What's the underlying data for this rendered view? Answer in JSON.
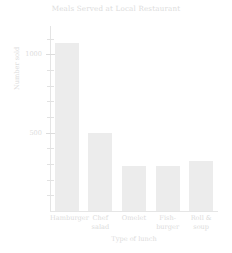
{
  "chart_data": {
    "type": "bar",
    "title": "Meals Served at Local Restaurant",
    "xlabel": "Type of lunch",
    "ylabel": "Number sold",
    "categories": [
      "Hamburger",
      "Chef\nsalad",
      "Omelet",
      "Fish-\nburger",
      "Roll &\nsoup"
    ],
    "values": [
      1070,
      500,
      285,
      285,
      320
    ],
    "ylim": [
      0,
      1180
    ],
    "yticks_major": [
      500,
      1000
    ],
    "ytick_labels": [
      "500",
      "1000"
    ],
    "yticks_minor": [
      100,
      200,
      300,
      400,
      600,
      700,
      800,
      900,
      1100
    ],
    "grid": false,
    "legend": null,
    "bar_color": "#ececec",
    "axis_color": "#e4e4e4",
    "text_color": "#dcdcdc"
  },
  "chart": {
    "title": "Meals Served at Local Restaurant",
    "x_axis_title": "Type of lunch",
    "y_axis_title": "Number sold",
    "y_labels": {
      "t1000": "1000",
      "t500": "500"
    },
    "bars": [
      {
        "label": "Hamburger",
        "value": 1070
      },
      {
        "label": "Chef\nsalad",
        "value": 500
      },
      {
        "label": "Omelet",
        "value": 285
      },
      {
        "label": "Fish-\nburger",
        "value": 285
      },
      {
        "label": "Roll &\nsoup",
        "value": 320
      }
    ]
  }
}
